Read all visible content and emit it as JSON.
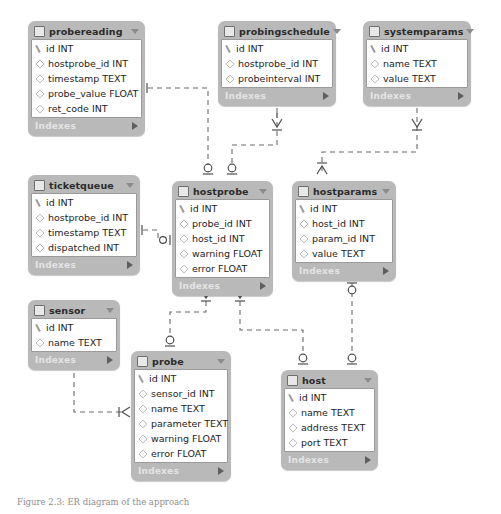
{
  "diagram": {
    "caption": "Figure 2.3: ER diagram of the approach",
    "style": {
      "header_bg": "#b9b9b9",
      "body_bg": "#ffffff",
      "footer_text": "#e4e4e4",
      "line_color": "#6b6b6b",
      "border": "#9a9a9a"
    },
    "footer_label": "Indexes",
    "icons": {
      "table": "table-square-icon",
      "collapse": "caret-down-icon",
      "primary_key": "key-icon",
      "column": "diamond-icon",
      "expand": "triangle-right-icon"
    }
  },
  "tables": [
    {
      "id": "probereading",
      "name": "probereading",
      "x": 28,
      "y": 21,
      "w": 117,
      "fields": [
        {
          "icon": "key-icon",
          "label": "id INT"
        },
        {
          "icon": "diamond-icon",
          "label": "hostprobe_id INT"
        },
        {
          "icon": "diamond-icon",
          "label": "timestamp TEXT"
        },
        {
          "icon": "diamond-icon",
          "label": "probe_value FLOAT"
        },
        {
          "icon": "diamond-icon",
          "label": "ret_code INT"
        }
      ]
    },
    {
      "id": "probingschedule",
      "name": "probingschedule",
      "x": 218,
      "y": 21,
      "w": 118,
      "fields": [
        {
          "icon": "key-icon",
          "label": "id INT"
        },
        {
          "icon": "diamond-icon",
          "label": "hostprobe_id INT"
        },
        {
          "icon": "diamond-icon",
          "label": "probeinterval INT"
        }
      ]
    },
    {
      "id": "systemparams",
      "name": "systemparams",
      "x": 363,
      "y": 21,
      "w": 108,
      "fields": [
        {
          "icon": "key-icon",
          "label": "id INT"
        },
        {
          "icon": "diamond-icon",
          "label": "name TEXT"
        },
        {
          "icon": "diamond-icon",
          "label": "value TEXT"
        }
      ]
    },
    {
      "id": "ticketqueue",
      "name": "ticketqueue",
      "x": 28,
      "y": 175,
      "w": 112,
      "fields": [
        {
          "icon": "key-icon",
          "label": "id INT"
        },
        {
          "icon": "diamond-icon",
          "label": "hostprobe_id INT"
        },
        {
          "icon": "diamond-icon",
          "label": "timestamp TEXT"
        },
        {
          "icon": "diamond-icon",
          "label": "dispatched INT"
        }
      ]
    },
    {
      "id": "hostprobe",
      "name": "hostprobe",
      "x": 172,
      "y": 181,
      "w": 101,
      "fields": [
        {
          "icon": "key-icon",
          "label": "id INT"
        },
        {
          "icon": "diamond-icon",
          "label": "probe_id INT"
        },
        {
          "icon": "diamond-icon",
          "label": "host_id INT"
        },
        {
          "icon": "diamond-icon",
          "label": "warning FLOAT"
        },
        {
          "icon": "diamond-icon",
          "label": "error FLOAT"
        }
      ]
    },
    {
      "id": "hostparams",
      "name": "hostparams",
      "x": 292,
      "y": 181,
      "w": 104,
      "fields": [
        {
          "icon": "key-icon",
          "label": "id INT"
        },
        {
          "icon": "diamond-icon",
          "label": "host_id INT"
        },
        {
          "icon": "diamond-icon",
          "label": "param_id INT"
        },
        {
          "icon": "diamond-icon",
          "label": "value TEXT"
        }
      ]
    },
    {
      "id": "sensor",
      "name": "sensor",
      "x": 28,
      "y": 300,
      "w": 92,
      "fields": [
        {
          "icon": "key-icon",
          "label": "id INT"
        },
        {
          "icon": "diamond-icon",
          "label": "name TEXT"
        }
      ]
    },
    {
      "id": "probe",
      "name": "probe",
      "x": 131,
      "y": 351,
      "w": 100,
      "fields": [
        {
          "icon": "key-icon",
          "label": "id INT"
        },
        {
          "icon": "diamond-icon",
          "label": "sensor_id INT"
        },
        {
          "icon": "diamond-icon",
          "label": "name TEXT"
        },
        {
          "icon": "diamond-icon",
          "label": "parameter TEXT"
        },
        {
          "icon": "diamond-icon",
          "label": "warning FLOAT"
        },
        {
          "icon": "diamond-icon",
          "label": "error FLOAT"
        }
      ]
    },
    {
      "id": "host",
      "name": "host",
      "x": 281,
      "y": 370,
      "w": 97,
      "fields": [
        {
          "icon": "key-icon",
          "label": "id INT"
        },
        {
          "icon": "diamond-icon",
          "label": "name TEXT"
        },
        {
          "icon": "diamond-icon",
          "label": "address TEXT"
        },
        {
          "icon": "diamond-icon",
          "label": "port TEXT"
        }
      ]
    }
  ],
  "relationships": [
    {
      "from": "hostprobe",
      "to": "probereading",
      "type": "one-to-many"
    },
    {
      "from": "hostprobe",
      "to": "probingschedule",
      "type": "one-to-many"
    },
    {
      "from": "hostprobe",
      "to": "ticketqueue",
      "type": "one-to-many"
    },
    {
      "from": "host",
      "to": "hostparams",
      "type": "one-to-many"
    },
    {
      "from": "systemparams",
      "to": "hostparams",
      "type": "one-to-many"
    },
    {
      "from": "probe",
      "to": "hostprobe",
      "type": "one-to-many"
    },
    {
      "from": "host",
      "to": "hostprobe",
      "type": "one-to-many"
    },
    {
      "from": "sensor",
      "to": "probe",
      "type": "one-to-many"
    }
  ]
}
